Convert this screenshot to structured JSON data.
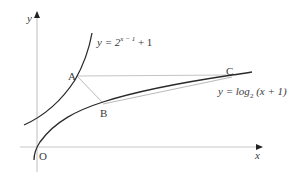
{
  "figure": {
    "axes": {
      "x_label": "x",
      "y_label": "y",
      "origin_label": "O"
    },
    "curves": [
      {
        "name": "exponential",
        "label_prefix": "y = 2",
        "label_exponent": "x − 1",
        "label_suffix": " + 1"
      },
      {
        "name": "logarithm",
        "label_prefix": "y = log",
        "label_subscript": "2",
        "label_suffix": " (x + 1)"
      }
    ],
    "points": [
      {
        "label": "A"
      },
      {
        "label": "B"
      },
      {
        "label": "C"
      }
    ],
    "colors": {
      "curve": "#2a2a2a",
      "axis": "#c8c8c8",
      "guide": "#b4b4b4",
      "text": "#3a3a3a"
    }
  }
}
